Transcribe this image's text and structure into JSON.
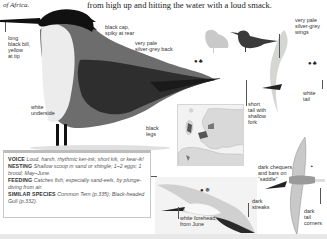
{
  "page": {
    "intro_tail": "of Africa.",
    "headline": "from high up and hitting the water with a loud smack."
  },
  "main_illustration": {
    "subject": "standing tern, close-up",
    "labels": {
      "bill": [
        "long",
        "black bill,",
        "yellow",
        "at tip"
      ],
      "cap": [
        "black cap,",
        "spiky at rear"
      ],
      "back": [
        "very pale",
        "silver-grey back"
      ],
      "underside": [
        "white",
        "underside"
      ],
      "legs": [
        "black",
        "legs"
      ]
    }
  },
  "comparison_silhouettes": {
    "items": [
      {
        "name": "pale-gull-silhouette",
        "color": "#c9c9c9"
      },
      {
        "name": "tern-silhouette",
        "color": "#3a3a3a"
      }
    ]
  },
  "symbols": {
    "upper": {
      "icons": [
        "habitat-icon",
        "nest-icon"
      ],
      "glyphs": "☘ ⚓"
    },
    "right": {
      "icons": [
        "habitat-icon",
        "nest-icon"
      ],
      "glyphs": "☘ ⚓"
    },
    "flight": {
      "icons": [
        "habitat-icon",
        "winter-icon"
      ],
      "glyphs": "☘ ❄"
    },
    "juvenile": {
      "icons": [
        "age-icon"
      ],
      "glyphs": "◔"
    }
  },
  "flight_adult_top": {
    "labels": {
      "wings": [
        "very pale",
        "silver-grey",
        "wings"
      ],
      "tail": [
        "white",
        "tail"
      ],
      "short_tail": [
        "short",
        "tail with",
        "shallow",
        "fork"
      ]
    }
  },
  "flight_juvenile": {
    "labels": {
      "saddle": [
        "dark chequers",
        "and bars on",
        "“saddle”"
      ],
      "tail_corners": [
        "dark",
        "tail",
        "corners"
      ]
    }
  },
  "flight_winter": {
    "labels": {
      "forehead": [
        "white forehead,",
        "from June"
      ],
      "streaks": [
        "dark",
        "streaks"
      ]
    }
  },
  "info_box": {
    "voice": {
      "key": "VOICE",
      "value": "Loud, harsh, rhythmic ker-ink, short kik, or kear-ik!"
    },
    "nesting": {
      "key": "NESTING",
      "value": "Shallow scoop in sand or shingle; 1–2 eggs; 1 brood; May–June."
    },
    "feeding": {
      "key": "FEEDING",
      "value": "Catches fish, especially sand-eels, by plunge-diving from air."
    },
    "similar": {
      "key": "SIMILAR SPECIES",
      "value": "Common Tern (p.335); Black-headed Gull (p.332)."
    }
  },
  "map": {
    "region": "Europe",
    "highlight_color": "#555555",
    "land_color": "#d9d9d9",
    "sea_color": "#f2f2f2"
  }
}
